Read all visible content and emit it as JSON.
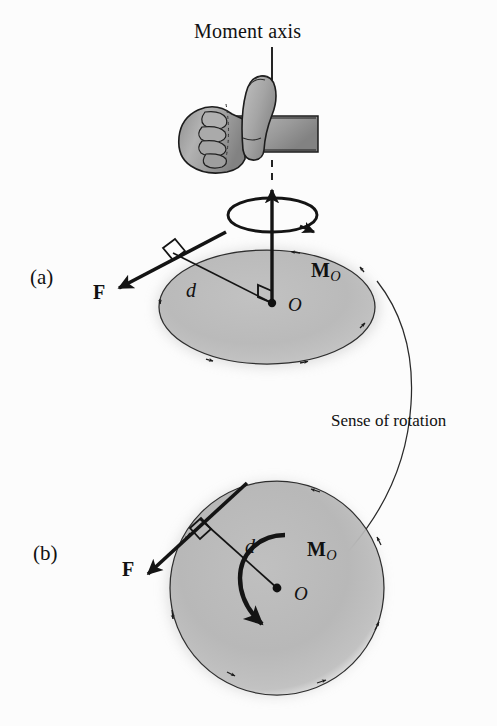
{
  "figure": {
    "title": "Moment axis",
    "panels": [
      {
        "id": "a",
        "label": "(a)",
        "view": "three-dimensional perspective view of disk with moment axis"
      },
      {
        "id": "b",
        "label": "(b)",
        "view": "top view of disk in plane of the force"
      }
    ],
    "callout": {
      "text": "Sense of rotation"
    },
    "symbols": {
      "force": "F",
      "moment": "M",
      "moment_subscript": "O",
      "distance": "d",
      "origin": "O"
    },
    "panel_a": {
      "force_label": "F",
      "distance_label": "d",
      "origin_label": "O",
      "moment_label": "M",
      "moment_sub": "O"
    },
    "panel_b": {
      "force_label": "F",
      "distance_label": "d",
      "origin_label": "O",
      "moment_label": "M",
      "moment_sub": "O"
    },
    "colors": {
      "ink": "#111111",
      "disk_fill": "#b9b9b9",
      "disk_edge": "#2b2b2b",
      "paper": "#fcfcfc",
      "hand_fill": "#a8a8a8"
    },
    "icons": {
      "hand": "right-hand-thumbs-up-icon",
      "axis": "moment-axis-line",
      "curl": "rotation-curl-arrow",
      "moment_arc": "moment-curved-arrow"
    }
  }
}
